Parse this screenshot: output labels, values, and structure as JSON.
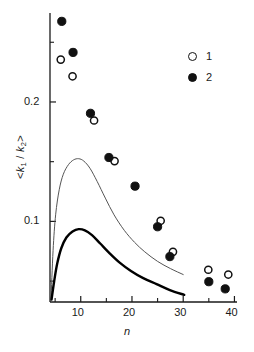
{
  "chart_data": {
    "type": "scatter",
    "title": "",
    "xlabel": "n",
    "ylabel": "<k1 / k2>",
    "ylabel_parts": {
      "prefix": "<",
      "num": "k",
      "num_sub": "1",
      "sep": " / ",
      "den": "k",
      "den_sub": "2",
      "suffix": ">"
    },
    "xlim": [
      4,
      40.5
    ],
    "ylim": [
      0.0325,
      0.2745
    ],
    "xticks_major": [
      10,
      20,
      30,
      40
    ],
    "xticks_minor": [
      5,
      15,
      25,
      35
    ],
    "xticklabels": [
      "10",
      "20",
      "30",
      "40"
    ],
    "yticks_major": [
      0.1,
      0.2
    ],
    "yticks_minor": [
      0.05,
      0.15,
      0.25
    ],
    "yticklabels": [
      "0.1",
      "0.2"
    ],
    "grid": false,
    "legend_position": "top-right",
    "legend": [
      {
        "label": "1",
        "marker": "open-circle",
        "color": "#111111"
      },
      {
        "label": "2",
        "marker": "filled-circle",
        "color": "#111111"
      }
    ],
    "series": [
      {
        "name": "1",
        "marker": "open-circle",
        "type": "scatter",
        "points": [
          {
            "x": 6.1,
            "y": 0.2355
          },
          {
            "x": 8.4,
            "y": 0.2215
          },
          {
            "x": 12.6,
            "y": 0.1845
          },
          {
            "x": 16.6,
            "y": 0.1505
          },
          {
            "x": 25.6,
            "y": 0.1005
          },
          {
            "x": 28.0,
            "y": 0.0745
          },
          {
            "x": 34.9,
            "y": 0.0595
          },
          {
            "x": 38.8,
            "y": 0.0555
          }
        ]
      },
      {
        "name": "2",
        "marker": "filled-circle",
        "type": "scatter",
        "points": [
          {
            "x": 6.3,
            "y": 0.2675
          },
          {
            "x": 8.5,
            "y": 0.2415
          },
          {
            "x": 11.9,
            "y": 0.1905
          },
          {
            "x": 15.5,
            "y": 0.1535
          },
          {
            "x": 20.6,
            "y": 0.1295
          },
          {
            "x": 25.0,
            "y": 0.0955
          },
          {
            "x": 27.4,
            "y": 0.0705
          },
          {
            "x": 35.0,
            "y": 0.0495
          },
          {
            "x": 38.2,
            "y": 0.0435
          }
        ]
      },
      {
        "name": "theory-thin",
        "marker": "none",
        "type": "line",
        "linewidth": 1,
        "color": "#555555",
        "points": [
          {
            "x": 4.2,
            "y": 0.0345
          },
          {
            "x": 4.6,
            "y": 0.0755
          },
          {
            "x": 5.1,
            "y": 0.1055
          },
          {
            "x": 5.8,
            "y": 0.1265
          },
          {
            "x": 6.6,
            "y": 0.1395
          },
          {
            "x": 7.6,
            "y": 0.1475
          },
          {
            "x": 8.6,
            "y": 0.1515
          },
          {
            "x": 9.6,
            "y": 0.1525
          },
          {
            "x": 10.6,
            "y": 0.1505
          },
          {
            "x": 11.8,
            "y": 0.1445
          },
          {
            "x": 13.2,
            "y": 0.1335
          },
          {
            "x": 14.8,
            "y": 0.1195
          },
          {
            "x": 16.5,
            "y": 0.1055
          },
          {
            "x": 18.5,
            "y": 0.0925
          },
          {
            "x": 20.5,
            "y": 0.0825
          },
          {
            "x": 22.5,
            "y": 0.0745
          },
          {
            "x": 25.0,
            "y": 0.0665
          },
          {
            "x": 27.5,
            "y": 0.0605
          },
          {
            "x": 30.0,
            "y": 0.0555
          }
        ]
      },
      {
        "name": "theory-thick",
        "marker": "none",
        "type": "line",
        "linewidth": 2.4,
        "color": "#000000",
        "points": [
          {
            "x": 4.3,
            "y": 0.0345
          },
          {
            "x": 4.8,
            "y": 0.0495
          },
          {
            "x": 5.4,
            "y": 0.0645
          },
          {
            "x": 6.2,
            "y": 0.0775
          },
          {
            "x": 7.2,
            "y": 0.0865
          },
          {
            "x": 8.4,
            "y": 0.0915
          },
          {
            "x": 9.6,
            "y": 0.0935
          },
          {
            "x": 10.8,
            "y": 0.0925
          },
          {
            "x": 12.2,
            "y": 0.0885
          },
          {
            "x": 13.8,
            "y": 0.0815
          },
          {
            "x": 15.6,
            "y": 0.0735
          },
          {
            "x": 17.6,
            "y": 0.0655
          },
          {
            "x": 19.8,
            "y": 0.0585
          },
          {
            "x": 22.2,
            "y": 0.0525
          },
          {
            "x": 24.8,
            "y": 0.0475
          },
          {
            "x": 27.4,
            "y": 0.0425
          },
          {
            "x": 30.2,
            "y": 0.0385
          }
        ]
      }
    ]
  },
  "axes": {
    "xtick_labels": [
      {
        "text": "10",
        "x": 10
      },
      {
        "text": "20",
        "x": 20
      },
      {
        "text": "30",
        "x": 30
      },
      {
        "text": "40",
        "x": 40
      }
    ],
    "ytick_labels": [
      {
        "text": "0.1",
        "y": 0.1
      },
      {
        "text": "0.2",
        "y": 0.2
      }
    ]
  }
}
